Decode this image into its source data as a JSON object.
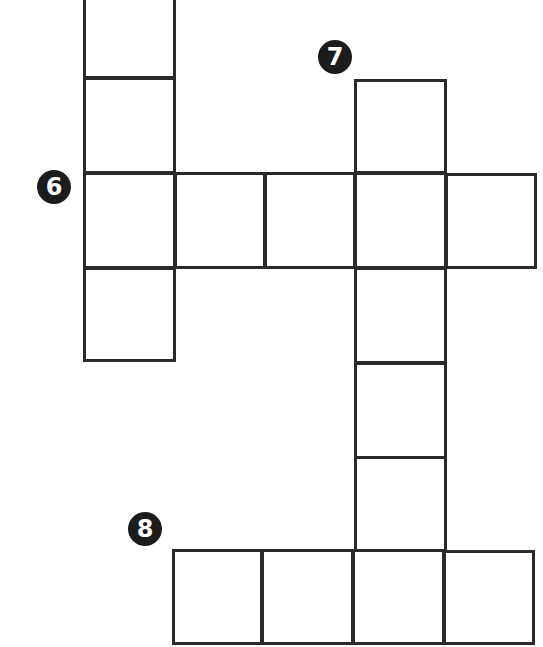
{
  "puzzle": {
    "type": "crossword-fragment",
    "line_color": "#2a2a2a",
    "clue_badge_color": "#1c1c1c",
    "clue_badge_text_color": "#ffffff",
    "clues": [
      {
        "number": "6",
        "direction": "across",
        "length": 5,
        "badge": {
          "cx": 54,
          "cy": 187
        }
      },
      {
        "number": "7",
        "direction": "down",
        "length": 6,
        "badge": {
          "cx": 335,
          "cy": 57
        }
      },
      {
        "number": "8",
        "direction": "across",
        "length": 4,
        "badge": {
          "cx": 145,
          "cy": 529
        }
      }
    ],
    "cells": [
      {
        "id": "c1",
        "x": 83,
        "y": -16,
        "w": 93,
        "h": 95,
        "group": "left-column",
        "value": ""
      },
      {
        "id": "c2",
        "x": 83,
        "y": 77,
        "w": 93,
        "h": 97,
        "group": "left-column",
        "value": ""
      },
      {
        "id": "c3",
        "x": 83,
        "y": 172,
        "w": 93,
        "h": 97,
        "group": "across-6",
        "value": ""
      },
      {
        "id": "c4",
        "x": 174,
        "y": 172,
        "w": 92,
        "h": 97,
        "group": "across-6",
        "value": ""
      },
      {
        "id": "c5",
        "x": 264,
        "y": 172,
        "w": 92,
        "h": 97,
        "group": "across-6",
        "value": ""
      },
      {
        "id": "c6",
        "x": 354,
        "y": 172,
        "w": 93,
        "h": 97,
        "group": "across-6",
        "value": ""
      },
      {
        "id": "c7",
        "x": 445,
        "y": 173,
        "w": 92,
        "h": 96,
        "group": "across-6",
        "value": ""
      },
      {
        "id": "c8",
        "x": 83,
        "y": 267,
        "w": 93,
        "h": 95,
        "group": "left-column",
        "value": ""
      },
      {
        "id": "c9",
        "x": 354,
        "y": 79,
        "w": 93,
        "h": 95,
        "group": "down-7",
        "value": ""
      },
      {
        "id": "c10",
        "x": 354,
        "y": 267,
        "w": 93,
        "h": 97,
        "group": "down-7",
        "value": ""
      },
      {
        "id": "c11",
        "x": 354,
        "y": 362,
        "w": 93,
        "h": 97,
        "group": "down-7",
        "value": ""
      },
      {
        "id": "c12",
        "x": 354,
        "y": 456,
        "w": 93,
        "h": 96,
        "group": "down-7",
        "value": ""
      },
      {
        "id": "c13",
        "x": 172,
        "y": 549,
        "w": 91,
        "h": 96,
        "group": "across-8",
        "value": ""
      },
      {
        "id": "c14",
        "x": 261,
        "y": 549,
        "w": 93,
        "h": 96,
        "group": "across-8",
        "value": ""
      },
      {
        "id": "c15",
        "x": 352,
        "y": 549,
        "w": 93,
        "h": 96,
        "group": "across-8",
        "value": ""
      },
      {
        "id": "c16",
        "x": 443,
        "y": 550,
        "w": 92,
        "h": 95,
        "group": "across-8",
        "value": ""
      }
    ]
  }
}
